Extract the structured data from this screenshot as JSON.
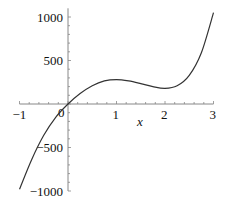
{
  "chart_data": {
    "type": "line",
    "title": "",
    "xlabel": "x",
    "ylabel": "",
    "xlim": [
      -1,
      3
    ],
    "ylim": [
      -1000,
      1050
    ],
    "grid": false,
    "legend": null,
    "x_ticks": [
      "-1",
      "0",
      "1",
      "2",
      "3"
    ],
    "y_ticks": [
      "-1000",
      "-500",
      "0",
      "500",
      "1000"
    ],
    "series": [
      {
        "name": "f(x)",
        "color": "#333333",
        "x": [
          -1.0,
          -0.75,
          -0.5,
          -0.25,
          0.0,
          0.25,
          0.5,
          0.75,
          1.0,
          1.25,
          1.5,
          1.75,
          2.0,
          2.25,
          2.5,
          2.75,
          3.0
        ],
        "y": [
          -980,
          -640,
          -360,
          -150,
          0,
          120,
          210,
          265,
          280,
          265,
          235,
          200,
          180,
          210,
          330,
          590,
          1050
        ]
      }
    ]
  },
  "axes": {
    "x_label": "x",
    "x_tick_labels": [
      "-1",
      "0",
      "1",
      "2",
      "3"
    ],
    "y_tick_labels": [
      "1000",
      "500",
      "-500",
      "-1000"
    ]
  }
}
